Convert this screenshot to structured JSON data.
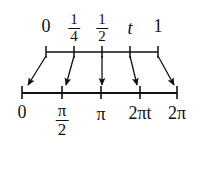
{
  "figure": {
    "background_color": "#ffffff",
    "ink_color": "#111111"
  },
  "top_axis": {
    "name": "parameter-axis",
    "range": [
      0,
      1
    ],
    "ticks": [
      {
        "id": "t0",
        "value": 0,
        "label": "0",
        "kind": "plain",
        "x": 46
      },
      {
        "id": "t1",
        "value": 0.25,
        "label": "1/4",
        "kind": "fraction",
        "num": "1",
        "den": "4",
        "x": 74
      },
      {
        "id": "t2",
        "value": 0.5,
        "label": "1/2",
        "kind": "fraction",
        "num": "1",
        "den": "2",
        "x": 102
      },
      {
        "id": "t3",
        "value": null,
        "label": "t",
        "kind": "italic",
        "x": 130
      },
      {
        "id": "t4",
        "value": 1,
        "label": "1",
        "kind": "plain",
        "x": 158
      }
    ]
  },
  "bottom_axis": {
    "name": "angle-axis",
    "range": [
      0,
      6.283185
    ],
    "ticks": [
      {
        "id": "b0",
        "value": 0,
        "label": "0",
        "kind": "plain",
        "x": 22
      },
      {
        "id": "b1",
        "value": 1.570796,
        "label": "π/2",
        "kind": "fraction",
        "num": "π",
        "den": "2",
        "x": 62
      },
      {
        "id": "b2",
        "value": 3.141593,
        "label": "π",
        "kind": "plain",
        "x": 101
      },
      {
        "id": "b3",
        "value": null,
        "label": "2πt",
        "kind": "italic-mixed",
        "x": 140
      },
      {
        "id": "b4",
        "value": 6.283185,
        "label": "2π",
        "kind": "plain",
        "x": 177
      }
    ]
  },
  "arrows": [
    {
      "id": "a0",
      "from": "t0",
      "to": "b0",
      "x1": 46,
      "y1": 56,
      "x2": 27,
      "y2": 87
    },
    {
      "id": "a1",
      "from": "t1",
      "to": "b1",
      "x1": 74,
      "y1": 56,
      "x2": 66,
      "y2": 87
    },
    {
      "id": "a2",
      "from": "t2",
      "to": "b2",
      "x1": 102,
      "y1": 56,
      "x2": 102,
      "y2": 87
    },
    {
      "id": "a3",
      "from": "t3",
      "to": "b3",
      "x1": 130,
      "y1": 56,
      "x2": 137,
      "y2": 87
    },
    {
      "id": "a4",
      "from": "t4",
      "to": "b4",
      "x1": 158,
      "y1": 56,
      "x2": 175,
      "y2": 87
    }
  ]
}
